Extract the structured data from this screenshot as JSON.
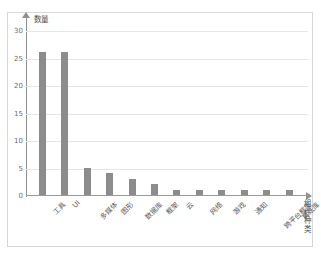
{
  "chart_data": {
    "type": "bar",
    "title": "",
    "xlabel": "组件种类",
    "ylabel": "数量",
    "categories": [
      "工具",
      "UI",
      "多媒体",
      "图形",
      "数据库",
      "框架",
      "云",
      "网络",
      "游戏",
      "通知",
      "跨平台框架",
      "算法库"
    ],
    "values": [
      26,
      26,
      5,
      4,
      3,
      2,
      1,
      1,
      1,
      1,
      1,
      1
    ],
    "ylim": [
      0,
      32
    ],
    "yticks": [
      "0",
      "5",
      "10",
      "15",
      "20",
      "25",
      "30"
    ],
    "ytick_values": [
      0,
      5,
      10,
      15,
      20,
      25,
      30
    ],
    "grid": true,
    "legend": false,
    "bar_color": "#8c8c8c",
    "grid_color": "#e6e6e6",
    "axis_color": "#8f8f8f",
    "frame_color": "#d8d8d8",
    "background": "#ffffff"
  }
}
